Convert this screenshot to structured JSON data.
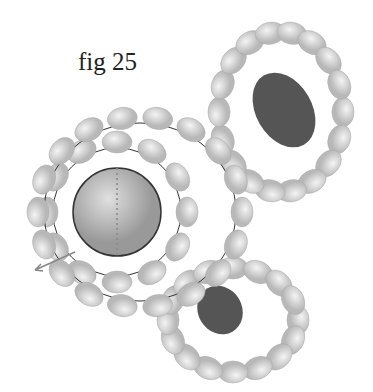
{
  "figure": {
    "title": "fig 25",
    "colors": {
      "bead": "#cfcfcf",
      "bead_edge": "#a8a8a8",
      "stone": "#555",
      "thread": "#333",
      "arrow": "#888"
    },
    "center_ball": {
      "cx": 117,
      "cy": 212,
      "r": 44
    },
    "rings": [
      {
        "cx": 117,
        "cy": 212,
        "rx": 70,
        "ry": 70,
        "n": 12,
        "brx": 15,
        "bry": 11
      },
      {
        "cx": 140,
        "cy": 212,
        "rx": 102,
        "ry": 95,
        "n": 18,
        "brx": 15,
        "bry": 11
      }
    ],
    "top_loop": {
      "cx": 281,
      "cy": 112,
      "rx": 62,
      "ry": 80,
      "n": 18,
      "stone": {
        "cx": 284,
        "cy": 110,
        "rx": 28,
        "ry": 40
      }
    },
    "bottom_loop": {
      "cx": 233,
      "cy": 320,
      "rx": 65,
      "ry": 52,
      "n": 16,
      "stone": {
        "cx": 220,
        "cy": 310,
        "rx": 22,
        "ry": 25
      }
    }
  }
}
